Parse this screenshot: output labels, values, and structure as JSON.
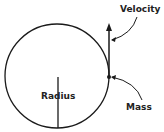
{
  "diagram": {
    "labels": {
      "velocity": "Velocity",
      "radius": "Radius",
      "mass": "Mass"
    },
    "colors": {
      "stroke": "#1a1a1a",
      "background": "#ffffff"
    }
  }
}
